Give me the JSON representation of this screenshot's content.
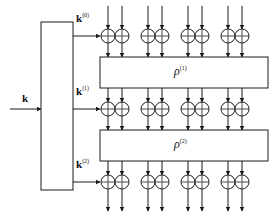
{
  "figure": {
    "type": "block-cipher-round-diagram",
    "background": "#ffffff",
    "line_color": "#1a1a1a",
    "gate_fill": "#ffffff",
    "width": 275,
    "height": 216
  },
  "key_schedule": {
    "name": "key-schedule-box",
    "input_label": "k",
    "outputs": [
      {
        "label_base": "k",
        "label_sup": "(0)",
        "full": "k(0)"
      },
      {
        "label_base": "k",
        "label_sup": "(1)",
        "full": "k(1)"
      },
      {
        "label_base": "k",
        "label_sup": "(2)",
        "full": "k(2)"
      }
    ],
    "box": {
      "x": 41,
      "y": 22,
      "w": 32,
      "h": 168
    }
  },
  "round_functions": [
    {
      "label_base": "ρ",
      "label_sup": "(1)",
      "full": "ρ(1)",
      "box": {
        "x": 100,
        "y": 57,
        "w": 168,
        "h": 31
      }
    },
    {
      "label_base": "ρ",
      "label_sup": "(2)",
      "full": "ρ(2)",
      "box": {
        "x": 100,
        "y": 130,
        "w": 168,
        "h": 31
      }
    }
  ],
  "xor_rows": [
    {
      "name": "xor-row-0",
      "cy": 36,
      "key": "k(0)"
    },
    {
      "name": "xor-row-1",
      "cy": 109,
      "key": "k(1)"
    },
    {
      "name": "xor-row-2",
      "cy": 182,
      "key": "k(2)"
    }
  ],
  "wire_columns": [
    108,
    122,
    148,
    162,
    188,
    202,
    228,
    242
  ],
  "gate": {
    "radius": 7,
    "symbol": "xor"
  },
  "wires": {
    "top_y": 6,
    "bottom_y": 211,
    "arrowheads": true
  }
}
